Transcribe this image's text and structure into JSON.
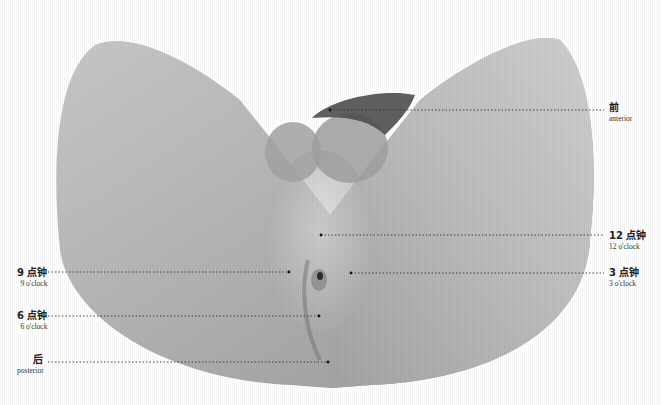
{
  "figure": {
    "colors": {
      "background": "#ffffff",
      "shape_light": "#d4d4d4",
      "shape_mid": "#a8a8a8",
      "shape_dark": "#555555",
      "leader_line": "#333333"
    }
  },
  "labels": [
    {
      "id": "anterior",
      "zh": "前",
      "en": "anterior",
      "side": "right",
      "text_x": 609,
      "text_y": 103,
      "point_x": 330,
      "point_y": 110
    },
    {
      "id": "12-oclock",
      "zh": "12 点钟",
      "en": "12 o'clock",
      "side": "right",
      "text_x": 609,
      "text_y": 231,
      "point_x": 321,
      "point_y": 235
    },
    {
      "id": "3-oclock",
      "zh": "3 点钟",
      "en": "3 o'clock",
      "side": "right",
      "text_x": 609,
      "text_y": 268,
      "point_x": 351,
      "point_y": 273
    },
    {
      "id": "9-oclock",
      "zh": "9 点钟",
      "en": "9 o'clock",
      "side": "left",
      "text_x": 17,
      "text_y": 268,
      "point_x": 289,
      "point_y": 272
    },
    {
      "id": "6-oclock",
      "zh": "6 点钟",
      "en": "6 o'clock",
      "side": "left",
      "text_x": 17,
      "text_y": 311,
      "point_x": 319,
      "point_y": 316
    },
    {
      "id": "posterior",
      "zh": "后",
      "en": "posterior",
      "side": "left",
      "text_x": 17,
      "text_y": 355,
      "point_x": 328,
      "point_y": 362
    }
  ]
}
